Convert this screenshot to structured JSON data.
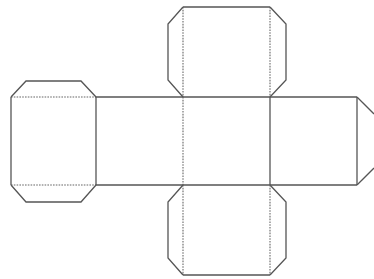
{
  "diagram": {
    "type": "cube-net",
    "colors": {
      "background": "#ffffff",
      "line": "#555555",
      "fold_line": "#666666"
    },
    "faces": [
      {
        "id": "face-left",
        "x": 11,
        "y": 97,
        "w": 85,
        "h": 88
      },
      {
        "id": "face-center-left",
        "x": 96,
        "y": 97,
        "w": 87,
        "h": 88
      },
      {
        "id": "face-center",
        "x": 183,
        "y": 97,
        "w": 87,
        "h": 88
      },
      {
        "id": "face-center-right",
        "x": 270,
        "y": 97,
        "w": 87,
        "h": 88
      },
      {
        "id": "face-top",
        "x": 183,
        "y": 7,
        "w": 87,
        "h": 90
      },
      {
        "id": "face-bottom",
        "x": 183,
        "y": 185,
        "w": 87,
        "h": 90
      }
    ],
    "tabs": [
      "left-face-top-tab",
      "left-face-bottom-tab",
      "top-face-left-tab",
      "top-face-right-tab",
      "bottom-face-left-tab",
      "bottom-face-right-tab",
      "right-face-right-tab"
    ]
  }
}
